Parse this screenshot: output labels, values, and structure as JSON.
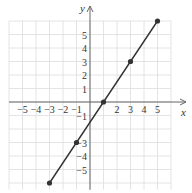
{
  "chart_data": {
    "type": "line",
    "title": "",
    "xlabel": "x",
    "ylabel": "y",
    "xlim": [
      -6,
      6
    ],
    "ylim": [
      -6,
      6
    ],
    "grid": true,
    "x_ticks": [
      -5,
      -4,
      -3,
      -2,
      -1,
      2,
      3,
      4,
      5
    ],
    "y_ticks": [
      5,
      4,
      3,
      2,
      1,
      -1,
      -3,
      -4,
      -5
    ],
    "series": [
      {
        "name": "line",
        "equation": "y = 1.5x - 1.5",
        "x": [
          -3,
          -1,
          1,
          3,
          5
        ],
        "y": [
          -6,
          -3,
          0,
          3,
          6
        ],
        "marked_points": [
          [
            -3,
            -6
          ],
          [
            -1,
            -3
          ],
          [
            1,
            0
          ],
          [
            3,
            3
          ],
          [
            5,
            6
          ]
        ]
      }
    ],
    "colors": {
      "line": "#333333",
      "grid": "#dddddd",
      "axis": "#666666"
    }
  }
}
